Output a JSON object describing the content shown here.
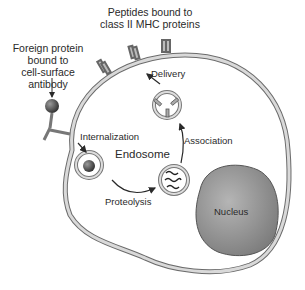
{
  "diagram": {
    "labels": {
      "peptides": "Peptides bound to\nclass II MHC proteins",
      "foreign_protein": "Foreign protein\nbound to\ncell-surface\nantibody",
      "delivery": "Delivery",
      "internalization": "Internalization",
      "endosome": "Endosome",
      "association": "Association",
      "proteolysis": "Proteolysis",
      "nucleus": "Nucleus"
    },
    "colors": {
      "membrane_fill": "#d9d9d9",
      "membrane_stroke": "#6b6b6b",
      "nucleus_fill": "#8c8c8c",
      "nucleus_highlight": "#b5b5b5",
      "antigen_sphere": "#4a4a4a",
      "text": "#2a2a2a",
      "arrow": "#2a2a2a"
    },
    "steps": [
      "Internalization",
      "Proteolysis",
      "Association",
      "Delivery"
    ]
  }
}
